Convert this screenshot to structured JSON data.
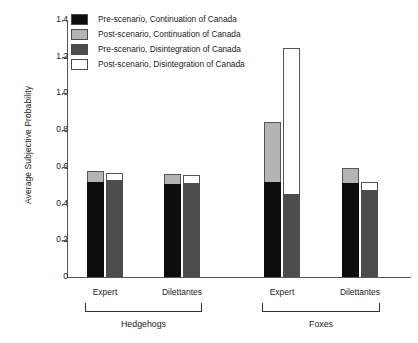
{
  "chart_data": {
    "type": "bar",
    "title": "",
    "xlabel": "",
    "ylabel": "Average Subjective Probability",
    "ylim": [
      0,
      1.4
    ],
    "ytick_labels": [
      "1.4",
      "1.2",
      "1.0",
      "0.8",
      "0.6",
      "0.4",
      "0.2",
      "0"
    ],
    "ytick_values": [
      1.4,
      1.2,
      1.0,
      0.8,
      0.6,
      0.4,
      0.2,
      0
    ],
    "grid": false,
    "legend_position": "top-left",
    "stacked": true,
    "categories": [
      "Expert",
      "Dilettantes",
      "Expert",
      "Dilettantes"
    ],
    "super_categories": [
      "Hedgehogs",
      "Foxes"
    ],
    "series": [
      {
        "name": "Pre-scenario, Continuation of Canada",
        "color": "#0d0d0d",
        "values": [
          0.52,
          0.505,
          0.52,
          0.51
        ]
      },
      {
        "name": "Post-scenario, Continuation of Canada",
        "color": "#b4b4b4",
        "values": [
          0.58,
          0.56,
          0.845,
          0.595
        ]
      },
      {
        "name": "Pre-scenario, Disintegration of Canada",
        "color": "#4d4d4d",
        "values": [
          0.53,
          0.51,
          0.45,
          0.475
        ]
      },
      {
        "name": "Post-scenario, Disintegration of Canada",
        "color": "#ffffff",
        "values": [
          0.565,
          0.555,
          1.25,
          0.515
        ]
      }
    ],
    "groups": [
      {
        "super": "Hedgehogs",
        "sub": "Expert",
        "continuation": {
          "pre": 0.52,
          "post": 0.58
        },
        "disintegration": {
          "pre": 0.53,
          "post": 0.565
        }
      },
      {
        "super": "Hedgehogs",
        "sub": "Dilettantes",
        "continuation": {
          "pre": 0.505,
          "post": 0.56
        },
        "disintegration": {
          "pre": 0.51,
          "post": 0.555
        }
      },
      {
        "super": "Foxes",
        "sub": "Expert",
        "continuation": {
          "pre": 0.52,
          "post": 0.845
        },
        "disintegration": {
          "pre": 0.45,
          "post": 1.25
        }
      },
      {
        "super": "Foxes",
        "sub": "Dilettantes",
        "continuation": {
          "pre": 0.51,
          "post": 0.595
        },
        "disintegration": {
          "pre": 0.475,
          "post": 0.515
        }
      }
    ]
  },
  "legend": {
    "items": [
      {
        "label": "Pre-scenario, Continuation of Canada",
        "color": "#0d0d0d"
      },
      {
        "label": "Post-scenario, Continuation of Canada",
        "color": "#b4b4b4"
      },
      {
        "label": "Pre-scenario, Disintegration of Canada",
        "color": "#4d4d4d"
      },
      {
        "label": "Post-scenario, Disintegration of Canada",
        "color": "#ffffff"
      }
    ]
  },
  "axis": {
    "y_title": "Average Subjective Probability",
    "y_ticks": [
      "1.4",
      "1.2",
      "1.0",
      "0.8",
      "0.6",
      "0.4",
      "0.2",
      "0"
    ]
  },
  "x_axis": {
    "sub_labels": [
      "Expert",
      "Dilettantes",
      "Expert",
      "Dilettantes"
    ],
    "group_labels": [
      "Hedgehogs",
      "Foxes"
    ]
  }
}
